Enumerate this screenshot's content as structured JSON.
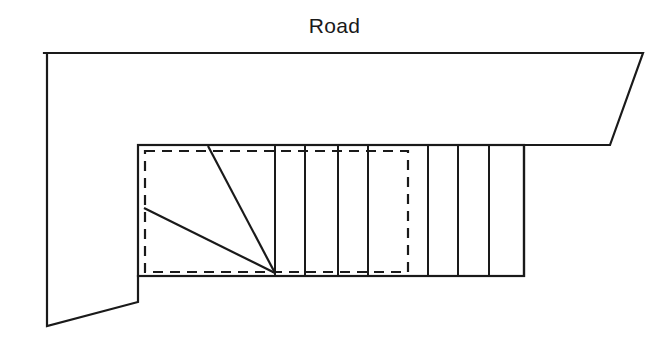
{
  "diagram": {
    "title": "Road",
    "colors": {
      "stroke": "#1a1a1a",
      "background": "#ffffff"
    },
    "labels": {
      "road": "Road"
    },
    "site_boundary": {
      "name": "site-boundary",
      "style": "solid",
      "stroke_width": 2.2,
      "points": "44,53 643,53 610,145 524,145 524,276 138,276 138,302 47,326 47,53"
    },
    "building_outline": {
      "name": "building-outline",
      "style": "solid",
      "stroke_width": 2.2,
      "x": 138,
      "y": 145,
      "width": 386,
      "height": 131
    },
    "setback_rectangle": {
      "name": "setback-rectangle",
      "style": "dashed",
      "stroke_width": 2.2,
      "dash_pattern": "10,7",
      "x": 145,
      "y": 151,
      "width": 263,
      "height": 121
    },
    "grid_lines": [
      {
        "name": "grid-line-1",
        "x": 275,
        "y1": 145,
        "y2": 276
      },
      {
        "name": "grid-line-2",
        "x": 305,
        "y1": 145,
        "y2": 276
      },
      {
        "name": "grid-line-3",
        "x": 338,
        "y1": 145,
        "y2": 276
      },
      {
        "name": "grid-line-4",
        "x": 368,
        "y1": 145,
        "y2": 276
      },
      {
        "name": "grid-line-5",
        "x": 428,
        "y1": 145,
        "y2": 276
      },
      {
        "name": "grid-line-6",
        "x": 458,
        "y1": 145,
        "y2": 276
      },
      {
        "name": "grid-line-7",
        "x": 489,
        "y1": 145,
        "y2": 276
      }
    ],
    "diagonals": [
      {
        "name": "diagonal-upper",
        "x1": 208,
        "y1": 146,
        "x2": 275,
        "y2": 273
      },
      {
        "name": "diagonal-lower",
        "x1": 144,
        "y1": 208,
        "x2": 275,
        "y2": 273
      }
    ]
  }
}
